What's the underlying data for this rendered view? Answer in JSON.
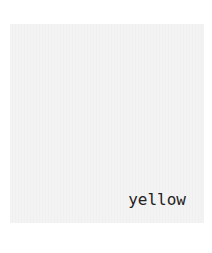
{
  "swatch": {
    "label": "yellow",
    "background_color": "#f2f2f2",
    "text_color": "#222222"
  }
}
